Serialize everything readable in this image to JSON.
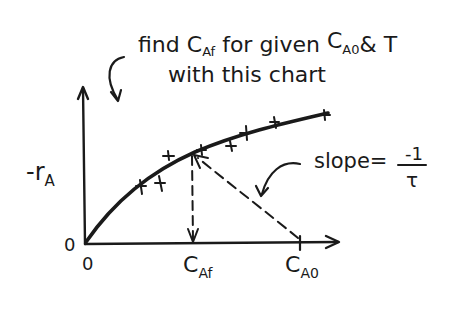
{
  "annotation": {
    "line1_prefix": "find ",
    "line1_c": "C",
    "line1_sub_af": "Af",
    "line1_mid": " for given ",
    "line1_c2": "C",
    "line1_sub_a0": "A0",
    "line1_suffix": "& T",
    "line2": "with this chart"
  },
  "axes": {
    "y_label_main": "-r",
    "y_label_sub": "A",
    "origin_y_label": "0",
    "origin_x_label": "0"
  },
  "x_labels": {
    "c_af_main": "C",
    "c_af_sub": "Af",
    "c_a0_main": "C",
    "c_a0_sub": "A0"
  },
  "slope_label": {
    "prefix": "slope=",
    "numerator": "-1",
    "denominator": "τ"
  },
  "colors": {
    "ink": "#1a1a1a",
    "background": "#ffffff"
  }
}
